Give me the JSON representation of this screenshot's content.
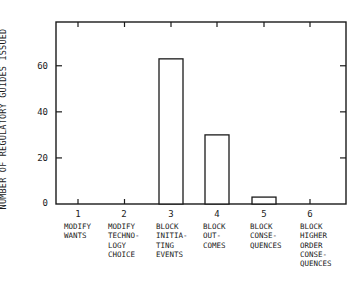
{
  "chart_data": {
    "type": "bar",
    "title": "",
    "xlabel": "",
    "ylabel": "NUMBER OF REGULATORY GUIDES ISSUED",
    "ylim": [
      0,
      79
    ],
    "yticks": [
      0,
      20,
      40,
      60
    ],
    "grid": false,
    "legend": null,
    "categories": [
      "1",
      "2",
      "3",
      "4",
      "5",
      "6"
    ],
    "category_labels": [
      "MODIFY\nWANTS",
      "MODIFY\nTECHNO-\nLOGY\nCHOICE",
      "BLOCK\nINITIA-\nTING\nEVENTS",
      "BLOCK\nOUT-\nCOMES",
      "BLOCK\nCONSE-\nQUENCES",
      "BLOCK\nHIGHER\nORDER\nCONSE-\nQUENCES"
    ],
    "values": [
      0,
      0,
      63,
      30,
      3,
      0
    ]
  },
  "axis": {
    "ylabel": "NUMBER OF REGULATORY GUIDES ISSUED",
    "ytick_labels": [
      "0",
      "20",
      "40",
      "60"
    ],
    "x_numbers": [
      "1",
      "2",
      "3",
      "4",
      "5",
      "6"
    ],
    "x_labels": [
      "MODIFY\nWANTS",
      "MODIFY\nTECHNO-\nLOGY\nCHOICE",
      "BLOCK\nINITIA-\nTING\nEVENTS",
      "BLOCK\nOUT-\nCOMES",
      "BLOCK\nCONSE-\nQUENCES",
      "BLOCK\nHIGHER\nORDER\nCONSE-\nQUENCES"
    ]
  }
}
